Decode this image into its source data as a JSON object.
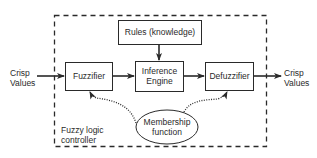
{
  "diagram": {
    "title": "Fuzzy logic controller",
    "container_label_line1": "Fuzzy logic",
    "container_label_line2": "controller",
    "input": {
      "line1": "Crisp",
      "line2": "Values"
    },
    "output": {
      "line1": "Crisp",
      "line2": "Values"
    },
    "nodes": {
      "rules": "Rules (knowledge)",
      "fuzzifier": "Fuzzifier",
      "inference_line1": "Inference",
      "inference_line2": "Engine",
      "defuzzifier": "Defuzzifier",
      "membership_line1": "Membership",
      "membership_line2": "function"
    },
    "edges": [
      {
        "from": "Crisp Values (input)",
        "to": "Fuzzifier",
        "style": "solid"
      },
      {
        "from": "Fuzzifier",
        "to": "Inference Engine",
        "style": "solid"
      },
      {
        "from": "Rules (knowledge)",
        "to": "Inference Engine",
        "style": "solid"
      },
      {
        "from": "Inference Engine",
        "to": "Defuzzifier",
        "style": "solid"
      },
      {
        "from": "Defuzzifier",
        "to": "Crisp Values (output)",
        "style": "solid"
      },
      {
        "from": "Membership function",
        "to": "Fuzzifier",
        "style": "dotted"
      },
      {
        "from": "Membership function",
        "to": "Defuzzifier",
        "style": "dotted"
      }
    ],
    "colors": {
      "stroke": "#2a2a2a",
      "background": "#ffffff"
    }
  }
}
